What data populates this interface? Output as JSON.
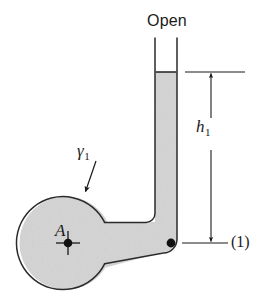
{
  "figure": {
    "background_color": "#ffffff",
    "fluid_fill_color": "#d4d4d4",
    "outline_color": "#2b2b2b",
    "annotation_color": "#1a1a1a"
  },
  "labels": {
    "open": "Open",
    "height": "h",
    "height_subscript": "1",
    "specific_weight": "γ",
    "specific_weight_subscript": "1",
    "point_a": "A",
    "station_1": "(1)"
  },
  "geometry": {
    "chamber_center_x": 66,
    "chamber_center_y": 243,
    "chamber_radius": 47,
    "tube_left_wall_x": 155,
    "tube_right_wall_x": 177,
    "tube_top_y": 38,
    "meniscus_y": 72,
    "station_1_y": 243,
    "station_1_dot_x": 177,
    "dimension_line_x": 211,
    "upper_tick_y": 72,
    "lower_tick_y": 243
  },
  "icons": {
    "point_marker": "crosshair-dot-icon",
    "station_marker": "filled-dot-icon",
    "leader": "leader-arrow-icon",
    "dimension": "dimension-arrow-icon"
  }
}
